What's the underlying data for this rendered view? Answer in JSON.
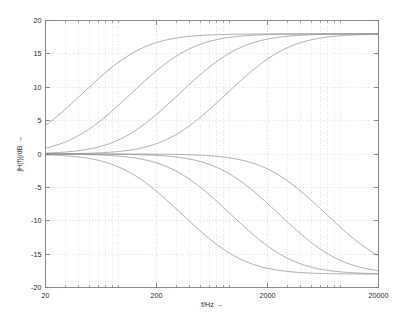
{
  "figure": {
    "background_color": "#ffffff",
    "axes_color": "#808080",
    "grid_color": "#d9d9d9",
    "curve_color": "#8c8c8c",
    "text_color": "#2b2b2b"
  },
  "chart_data": {
    "type": "line",
    "title": "",
    "subtitle": "",
    "xlabel": "f/Hz →",
    "ylabel": "|H(f)|/dB →",
    "xscale": "log",
    "yscale": "linear",
    "xlim": [
      20,
      20000
    ],
    "ylim": [
      -20,
      20
    ],
    "xticks": [
      20,
      200,
      2000,
      20000
    ],
    "xtick_labels": [
      "20",
      "200",
      "2000",
      "20000"
    ],
    "yticks": [
      -20,
      -15,
      -10,
      -5,
      0,
      5,
      10,
      15,
      20
    ],
    "ytick_labels": [
      "-20",
      "-15",
      "-10",
      "-5",
      "0",
      "5",
      "10",
      "15",
      "20"
    ],
    "grid": true,
    "grid_minor": true,
    "legend": false,
    "legend_position": "none",
    "annotations": [],
    "x": [
      20,
      28,
      40,
      56,
      80,
      112,
      160,
      224,
      316,
      447,
      630,
      891,
      1260,
      1780,
      2510,
      3550,
      5010,
      7080,
      10000,
      14100,
      20000
    ],
    "series": [
      {
        "name": "boost-fc-120",
        "gain_db": 18,
        "corner_hz": 120,
        "values": [
          0.0,
          0.3,
          0.8,
          1.7,
          3.1,
          4.9,
          7.2,
          9.6,
          11.9,
          13.8,
          15.2,
          16.2,
          16.9,
          17.3,
          17.6,
          17.8,
          17.9,
          17.9,
          18.0,
          18.0,
          18.0
        ]
      },
      {
        "name": "boost-fc-330",
        "gain_db": 18,
        "corner_hz": 330,
        "values": [
          0.0,
          0.1,
          0.2,
          0.4,
          0.8,
          1.5,
          2.8,
          4.6,
          7.0,
          9.4,
          11.5,
          13.3,
          14.8,
          15.8,
          16.6,
          17.1,
          17.5,
          17.7,
          17.8,
          17.9,
          18.0
        ]
      },
      {
        "name": "boost-fc-900",
        "gain_db": 18,
        "corner_hz": 900,
        "values": [
          0.0,
          0.0,
          0.1,
          0.1,
          0.2,
          0.4,
          0.8,
          1.5,
          2.8,
          4.6,
          6.8,
          9.1,
          11.3,
          13.2,
          14.7,
          15.8,
          16.6,
          17.1,
          17.5,
          17.7,
          17.9
        ]
      },
      {
        "name": "boost-fc-2400",
        "gain_db": 18,
        "corner_hz": 2400,
        "values": [
          0.0,
          0.0,
          0.0,
          0.0,
          0.1,
          0.1,
          0.2,
          0.4,
          0.8,
          1.5,
          2.7,
          4.5,
          6.6,
          8.9,
          11.1,
          13.0,
          14.6,
          15.7,
          16.5,
          17.1,
          17.6
        ]
      },
      {
        "name": "cut-fc-120",
        "gain_db": -18,
        "corner_hz": 120,
        "values": [
          0.0,
          -0.3,
          -0.8,
          -1.7,
          -3.1,
          -4.9,
          -7.2,
          -9.6,
          -11.9,
          -13.8,
          -15.2,
          -16.2,
          -16.9,
          -17.3,
          -17.6,
          -17.8,
          -17.9,
          -17.9,
          -18.0,
          -18.0,
          -18.0
        ]
      },
      {
        "name": "cut-fc-330",
        "gain_db": -18,
        "corner_hz": 330,
        "values": [
          0.0,
          -0.1,
          -0.2,
          -0.4,
          -0.8,
          -1.5,
          -2.8,
          -4.6,
          -7.0,
          -9.4,
          -11.5,
          -13.3,
          -14.8,
          -15.8,
          -16.6,
          -17.1,
          -17.5,
          -17.7,
          -17.8,
          -17.9,
          -18.0
        ]
      },
      {
        "name": "cut-fc-900",
        "gain_db": -18,
        "corner_hz": 900,
        "values": [
          0.0,
          0.0,
          -0.1,
          -0.1,
          -0.2,
          -0.4,
          -0.8,
          -1.5,
          -2.8,
          -4.6,
          -6.8,
          -9.1,
          -11.3,
          -13.2,
          -14.7,
          -15.8,
          -16.6,
          -17.1,
          -17.5,
          -17.7,
          -17.9
        ]
      },
      {
        "name": "cut-fc-2400",
        "gain_db": -18,
        "corner_hz": 2400,
        "values": [
          0.0,
          0.0,
          0.0,
          0.0,
          -0.1,
          -0.1,
          -0.2,
          -0.4,
          -0.8,
          -1.5,
          -2.7,
          -4.5,
          -6.6,
          -8.9,
          -11.1,
          -13.0,
          -14.6,
          -15.7,
          -16.5,
          -17.1,
          -17.6
        ]
      }
    ]
  }
}
